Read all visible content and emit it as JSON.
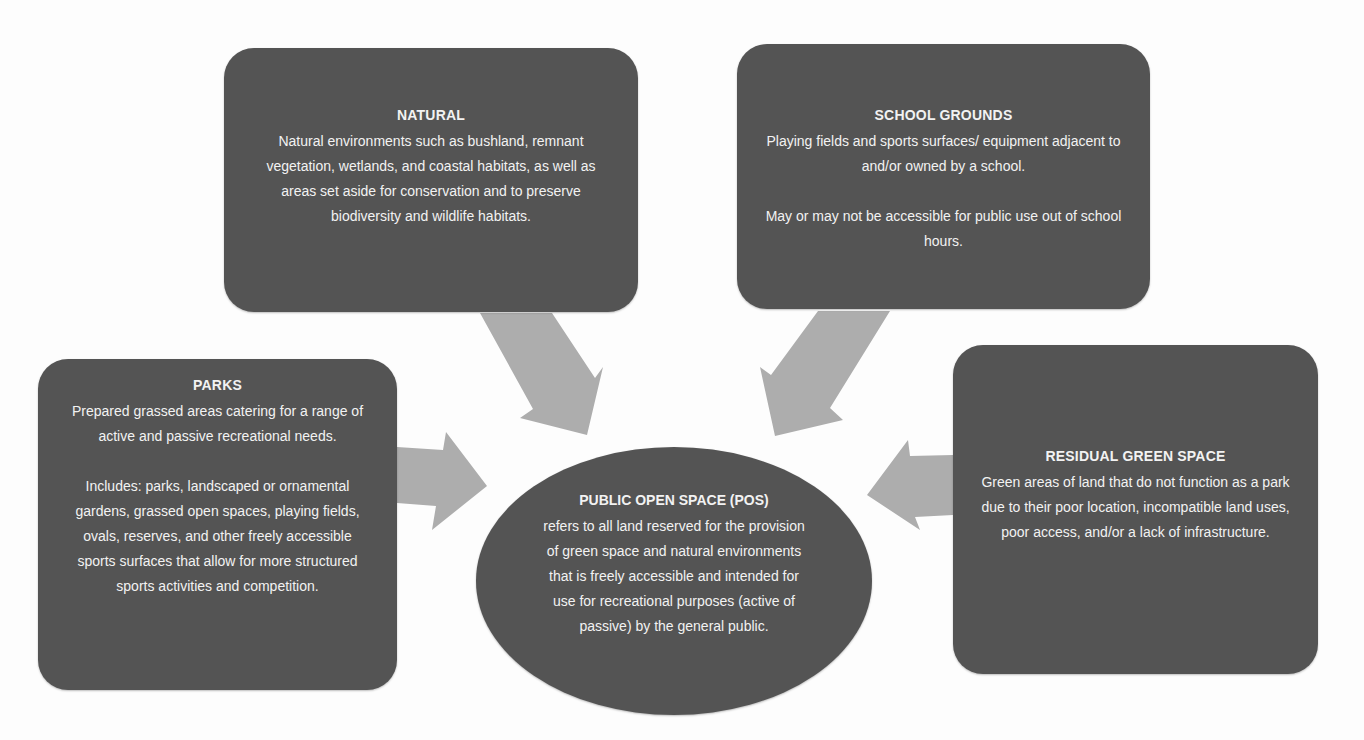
{
  "diagram": {
    "type": "hub-and-spoke concept diagram",
    "colors": {
      "box_fill": "#545454",
      "text": "#f2f2f2",
      "arrow_fill": "#adadad",
      "background": "#fdfdfd"
    },
    "center": {
      "title": "PUBLIC OPEN SPACE (POS)",
      "body": "refers to all land reserved for the provision of green space and natural environments that is freely accessible and intended for use for recreational purposes (active of passive) by the general public."
    },
    "categories": {
      "natural": {
        "title": "NATURAL",
        "paragraphs": [
          "Natural environments such as bushland, remnant vegetation, wetlands, and coastal habitats, as well as areas set aside for conservation and to preserve biodiversity and wildlife habitats."
        ]
      },
      "school_grounds": {
        "title": "SCHOOL GROUNDS",
        "paragraphs": [
          "Playing fields and sports surfaces/ equipment adjacent to and/or owned by a school.",
          "May or may not be accessible for public use out of school hours."
        ]
      },
      "parks": {
        "title": "PARKS",
        "paragraphs": [
          "Prepared grassed areas catering for a range of active and passive recreational needs.",
          "Includes: parks, landscaped or ornamental gardens, grassed open spaces, playing fields, ovals, reserves, and other freely accessible sports surfaces that allow for more structured sports activities and competition."
        ]
      },
      "residual_green_space": {
        "title": "RESIDUAL GREEN SPACE",
        "paragraphs": [
          "Green areas of land that do not function as a park due to their poor location, incompatible land uses, poor access, and/or a lack of infrastructure."
        ]
      }
    },
    "arrows": [
      {
        "from": "NATURAL",
        "to": "PUBLIC OPEN SPACE (POS)",
        "icon": "arrow-down-right-icon"
      },
      {
        "from": "SCHOOL GROUNDS",
        "to": "PUBLIC OPEN SPACE (POS)",
        "icon": "arrow-down-left-icon"
      },
      {
        "from": "PARKS",
        "to": "PUBLIC OPEN SPACE (POS)",
        "icon": "arrow-right-icon"
      },
      {
        "from": "RESIDUAL GREEN SPACE",
        "to": "PUBLIC OPEN SPACE (POS)",
        "icon": "arrow-left-icon"
      }
    ]
  }
}
